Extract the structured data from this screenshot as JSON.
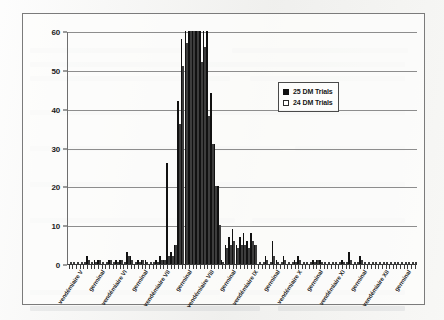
{
  "chart_data": {
    "type": "bar",
    "title": "",
    "xlabel": "",
    "ylabel": "",
    "ylim": [
      0,
      60
    ],
    "yticks": [
      0,
      10,
      20,
      30,
      40,
      50,
      60
    ],
    "grid": true,
    "legend_position": "upper-right",
    "legend": [
      "25 DM Trials",
      "24 DM Trials"
    ],
    "tick_labels": [
      {
        "index": 0,
        "label": "vendémiaire V"
      },
      {
        "index": 6,
        "label": "germinal"
      },
      {
        "index": 12,
        "label": "vendémiaire VI"
      },
      {
        "index": 18,
        "label": "germinal"
      },
      {
        "index": 24,
        "label": "vendémiaire VII"
      },
      {
        "index": 30,
        "label": "germinal"
      },
      {
        "index": 36,
        "label": "vendémiaire VIII"
      },
      {
        "index": 42,
        "label": "germinal"
      },
      {
        "index": 48,
        "label": "vendémiaire IX"
      },
      {
        "index": 54,
        "label": "germinal"
      },
      {
        "index": 60,
        "label": "vendémiaire X"
      },
      {
        "index": 66,
        "label": "germinal"
      },
      {
        "index": 72,
        "label": "vendémiaire XI"
      },
      {
        "index": 78,
        "label": "germinal"
      },
      {
        "index": 84,
        "label": "vendémiaire XII"
      },
      {
        "index": 90,
        "label": "germinal"
      }
    ],
    "categories": [
      "vendémiaire V",
      "brumaire V",
      "frimaire V",
      "nivôse V",
      "pluviôse V",
      "ventôse V",
      "germinal V",
      "floréal V",
      "prairial V",
      "messidor V",
      "thermidor V",
      "fructidor V",
      "vendémiaire VI",
      "brumaire VI",
      "frimaire VI",
      "nivôse VI",
      "pluviôse VI",
      "ventôse VI",
      "germinal VI",
      "floréal VI",
      "prairial VI",
      "messidor VI",
      "thermidor VI",
      "fructidor VI",
      "vendémiaire VII",
      "brumaire VII",
      "frimaire VII",
      "nivôse VII",
      "pluviôse VII",
      "ventôse VII",
      "germinal VII",
      "floréal VII",
      "prairial VII",
      "messidor VII",
      "thermidor VII",
      "fructidor VII",
      "vendémiaire VIII",
      "brumaire VIII",
      "frimaire VIII",
      "nivôse VIII",
      "pluviôse VIII",
      "ventôse VIII",
      "germinal VIII",
      "floréal VIII",
      "prairial VIII",
      "messidor VIII",
      "thermidor VIII",
      "fructidor VIII",
      "vendémiaire IX",
      "brumaire IX",
      "frimaire IX",
      "nivôse IX",
      "pluviôse IX",
      "ventôse IX",
      "germinal IX",
      "floréal IX",
      "prairial IX",
      "messidor IX",
      "thermidor IX",
      "fructidor IX",
      "vendémiaire X",
      "brumaire X",
      "frimaire X",
      "nivôse X",
      "pluviôse X",
      "ventôse X",
      "germinal X",
      "floréal X",
      "prairial X",
      "messidor X",
      "thermidor X",
      "fructidor X",
      "vendémiaire XI",
      "brumaire XI",
      "frimaire XI",
      "nivôse XI",
      "pluviôse XI",
      "ventôse XI",
      "germinal XI",
      "floréal XI",
      "prairial XI",
      "messidor XI",
      "thermidor XI",
      "fructidor XI",
      "vendémiaire XII",
      "brumaire XII",
      "frimaire XII",
      "nivôse XII",
      "pluviôse XII",
      "ventôse XII",
      "germinal XII",
      "floréal XII",
      "prairial XII",
      "messidor XII",
      "thermidor XII",
      "fructidor XII"
    ],
    "series": [
      {
        "name": "25 DM Trials",
        "color": "#111111",
        "values": [
          0,
          0,
          0,
          0,
          0,
          2,
          0,
          1,
          1,
          0,
          0,
          1,
          0,
          1,
          1,
          0,
          3,
          2,
          0,
          1,
          1,
          1,
          0,
          0,
          1,
          2,
          1,
          26,
          3,
          5,
          42,
          58,
          60,
          60,
          60,
          60,
          60,
          60,
          60,
          44,
          31,
          20,
          1,
          5,
          7,
          9,
          5,
          7,
          8,
          6,
          8,
          5,
          0,
          0,
          2,
          0,
          6,
          1,
          0,
          2,
          0,
          0,
          1,
          2,
          0,
          0,
          0,
          1,
          1,
          1,
          0,
          0,
          0,
          0,
          0,
          1,
          0,
          3,
          0,
          0,
          2,
          0,
          0,
          0,
          0,
          0,
          0,
          0,
          0,
          0,
          0,
          0,
          0,
          0,
          0,
          0
        ]
      },
      {
        "name": "24 DM Trials",
        "color": "#fbfbfb",
        "values": [
          0,
          0,
          0,
          0,
          0,
          1,
          0,
          0,
          1,
          0,
          0,
          1,
          0,
          0,
          1,
          0,
          2,
          1,
          0,
          0,
          1,
          0,
          0,
          0,
          0,
          1,
          1,
          2,
          2,
          5,
          36,
          51,
          57,
          60,
          60,
          60,
          52,
          56,
          38,
          31,
          20,
          10,
          0,
          4,
          5,
          6,
          4,
          5,
          5,
          4,
          6,
          5,
          0,
          0,
          1,
          0,
          2,
          0,
          0,
          1,
          0,
          0,
          0,
          1,
          0,
          0,
          0,
          0,
          1,
          0,
          0,
          0,
          0,
          0,
          0,
          0,
          0,
          1,
          0,
          0,
          1,
          0,
          0,
          0,
          0,
          0,
          0,
          0,
          0,
          0,
          0,
          0,
          0,
          0,
          0,
          0
        ]
      }
    ]
  }
}
